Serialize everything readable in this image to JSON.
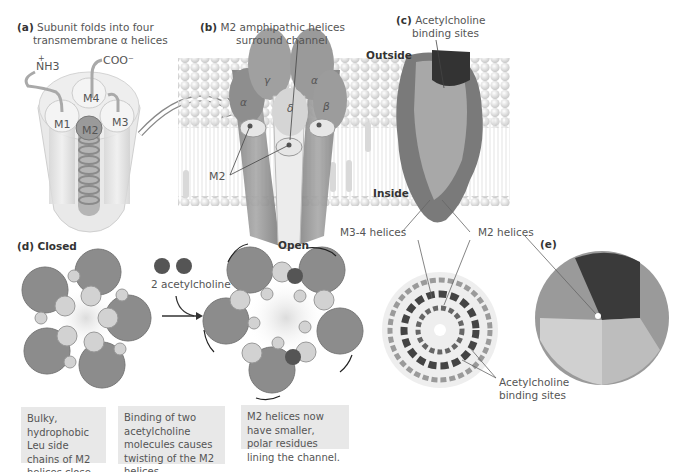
{
  "panels": {
    "a": {
      "letter": "(a)",
      "title_line1": "Subunit folds into four",
      "title_line2": "transmembrane α helices",
      "labels": {
        "nh3": "NH3",
        "nh3_charge": "+",
        "coo": "COO⁻",
        "m1": "M1",
        "m2": "M2",
        "m3": "M3",
        "m4": "M4"
      }
    },
    "b": {
      "letter": "(b)",
      "title_line1": "M2 amphipathic helices",
      "title_line2": "surround channel",
      "subunits": [
        "γ",
        "α",
        "α",
        "δ",
        "β"
      ],
      "m2_label": "M2"
    },
    "c": {
      "letter": "(c)",
      "title_line1": "Acetylcholine",
      "title_line2": "binding sites",
      "outside": "Outside",
      "inside": "Inside",
      "m34_label": "M3-4 helices",
      "m2_label": "M2 helices",
      "ach_line1": "Acetylcholine",
      "ach_line2": "binding sites"
    },
    "d": {
      "letter": "(d)",
      "closed": "Closed",
      "open": "Open",
      "ligand": "2 acetylcholine",
      "captions": [
        "Bulky, hydrophobic Leu side chains of M2 helices close the channel.",
        "Binding of two acetylcholine molecules causes twisting of the M2 helices.",
        "M2 helices now have smaller, polar residues lining the channel."
      ]
    },
    "e": {
      "letter": "(e)"
    }
  },
  "colors": {
    "subunit": "#8c8c8c",
    "helix_small": "#c8c8c8",
    "acetylcholine": "#555555",
    "membrane_head": "#e2e2e2",
    "caption_bg": "#e8e8e8"
  }
}
